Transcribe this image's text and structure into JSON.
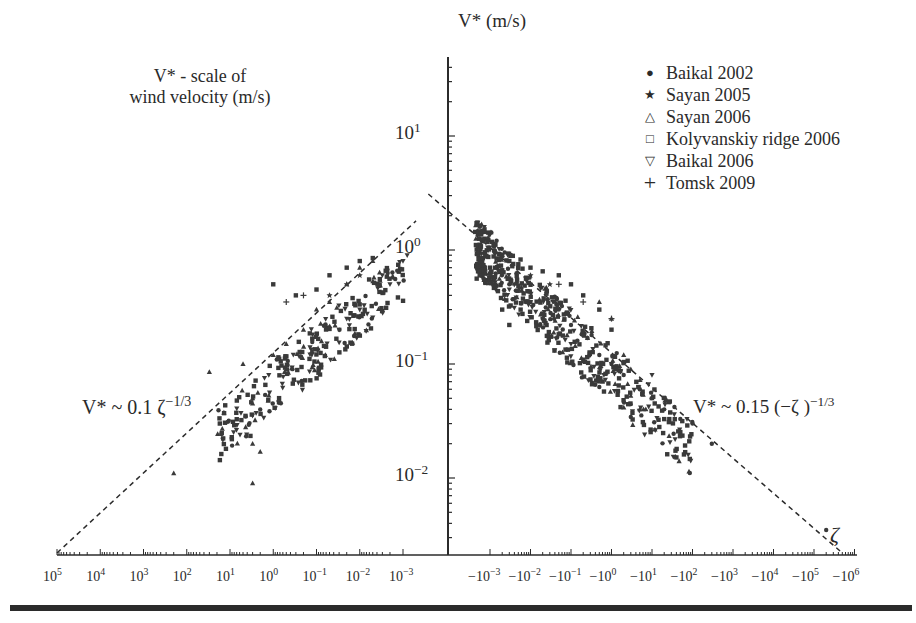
{
  "chart_data": {
    "type": "scatter",
    "title": "",
    "xlabel": "ζ",
    "ylabel": "V* (m/s)",
    "annotation_left_title": "V* - scale of wind velocity (m/s)",
    "xscale": "symlog (log of |ζ|, positive ζ on left decreasing toward center, negative ζ on right)",
    "yscale": "log",
    "ylim": [
      0.002,
      50
    ],
    "grid": false,
    "legend_position": "upper right",
    "y_ticks": [
      "10^1",
      "10^0",
      "10^-1",
      "10^-2"
    ],
    "x_ticks_left": [
      "10^5",
      "10^4",
      "10^3",
      "10^2",
      "10^1",
      "10^0",
      "10^-1",
      "10^-2",
      "10^-3"
    ],
    "x_ticks_right": [
      "-10^-3",
      "-10^-2",
      "-10^-1",
      "-10^0",
      "-10^1",
      "-10^2",
      "-10^3",
      "-10^4",
      "-10^5",
      "-10^6"
    ],
    "fit_lines": [
      {
        "label": "V* ~ 0.1 ζ^(-1/3)",
        "side": "stable (ζ>0)",
        "from": {
          "zeta": 100000,
          "v": 0.0022
        },
        "to": {
          "zeta": 0.0005,
          "v": 1.8
        }
      },
      {
        "label": "V* ~ 0.15 (-ζ)^(-1/3)",
        "side": "unstable (ζ<0)",
        "from": {
          "zeta": -3e-05,
          "v": 3.1
        },
        "to": {
          "zeta": -500000,
          "v": 0.0022
        }
      }
    ],
    "series": [
      {
        "name": "Baikal 2002",
        "marker": "circle",
        "points": [
          [
            -0.003,
            0.5
          ],
          [
            -0.01,
            0.35
          ],
          [
            -0.02,
            0.25
          ],
          [
            -0.05,
            0.3
          ],
          [
            -0.1,
            0.22
          ],
          [
            -0.2,
            0.18
          ],
          [
            -0.5,
            0.12
          ],
          [
            -1,
            0.1
          ],
          [
            -2,
            0.08
          ],
          [
            -5,
            0.06
          ],
          [
            -20,
            0.04
          ],
          [
            -50,
            0.033
          ],
          [
            -100,
            0.03
          ],
          [
            -300,
            0.02
          ],
          [
            -200000,
            0.0035
          ]
        ]
      },
      {
        "name": "Sayan 2005",
        "marker": "star",
        "points": [
          [
            0.05,
            0.4
          ],
          [
            0.02,
            0.5
          ],
          [
            0.01,
            0.6
          ],
          [
            -0.01,
            0.6
          ],
          [
            -0.03,
            0.5
          ]
        ]
      },
      {
        "name": "Sayan 2006",
        "marker": "triangle-up",
        "points": [
          [
            30,
            0.085
          ],
          [
            5,
            0.1
          ],
          [
            3,
            0.05
          ],
          [
            3,
            0.045
          ],
          [
            3,
            0.02
          ],
          [
            2,
            0.017
          ],
          [
            3,
            0.009
          ],
          [
            200,
            0.011
          ],
          [
            1,
            0.12
          ],
          [
            0.5,
            0.15
          ],
          [
            0.2,
            0.2
          ],
          [
            0.1,
            0.3
          ],
          [
            0.05,
            0.35
          ],
          [
            0.02,
            0.5
          ],
          [
            0.01,
            0.7
          ],
          [
            0.005,
            0.8
          ],
          [
            -0.5,
            0.35
          ],
          [
            -1,
            0.25
          ],
          [
            -2,
            0.12
          ],
          [
            -3,
            0.09
          ],
          [
            -10,
            0.05
          ],
          [
            -5,
            0.04
          ]
        ]
      },
      {
        "name": "Kolyvanskiy ridge 2006",
        "marker": "square",
        "points": [
          [
            1,
            0.5
          ],
          [
            0.3,
            0.4
          ],
          [
            0.1,
            0.45
          ],
          [
            0.05,
            0.6
          ],
          [
            0.02,
            0.7
          ],
          [
            0.01,
            0.8
          ],
          [
            0.005,
            0.85
          ],
          [
            -0.0005,
            0.75
          ],
          [
            -0.001,
            0.7
          ],
          [
            -0.002,
            0.9
          ],
          [
            -0.003,
            0.8
          ],
          [
            -0.005,
            0.75
          ],
          [
            -0.01,
            0.7
          ],
          [
            -0.02,
            0.65
          ],
          [
            -0.05,
            0.6
          ],
          [
            -0.1,
            0.5
          ],
          [
            -0.2,
            0.4
          ],
          [
            -0.5,
            0.3
          ],
          [
            -1,
            0.2
          ],
          [
            -0.002,
            0.3
          ],
          [
            -0.003,
            0.22
          ]
        ]
      },
      {
        "name": "Baikal 2006",
        "marker": "triangle-down",
        "points": [
          [
            0.003,
            0.6
          ],
          [
            0.002,
            0.5
          ],
          [
            0.001,
            0.8
          ],
          [
            0.0008,
            0.9
          ],
          [
            0.01,
            0.3
          ],
          [
            0.03,
            0.2
          ],
          [
            0.02,
            0.25
          ],
          [
            -0.001,
            1.0
          ],
          [
            -0.002,
            0.85
          ],
          [
            -0.003,
            0.45
          ],
          [
            -0.01,
            0.35
          ],
          [
            -0.02,
            0.25
          ],
          [
            -0.1,
            0.15
          ],
          [
            -1,
            0.1
          ],
          [
            -10,
            0.08
          ],
          [
            -20,
            0.05
          ]
        ]
      },
      {
        "name": "Tomsk 2009",
        "marker": "plus",
        "points": [
          [
            0.5,
            0.35
          ],
          [
            0.2,
            0.4
          ],
          [
            -0.05,
            0.5
          ],
          [
            -0.2,
            0.35
          ],
          [
            -1,
            0.25
          ]
        ]
      }
    ]
  },
  "labels": {
    "y_axis_title": "V* (m/s)",
    "left_note_line1": "V* - scale of",
    "left_note_line2": "wind velocity (m/s)",
    "fit_left": "V* ~ 0.1 ζ",
    "fit_left_exp": "−1/3",
    "fit_right": "V* ~ 0.15 (−ζ )",
    "fit_right_exp": "−1/3",
    "x_axis_symbol": "ζ"
  },
  "legend": [
    {
      "symbol": "●",
      "label": "Baikal 2002"
    },
    {
      "symbol": "★",
      "label": "Sayan 2005"
    },
    {
      "symbol": "△",
      "label": "Sayan 2006"
    },
    {
      "symbol": "□",
      "label": "Kolyvanskiy ridge 2006"
    },
    {
      "symbol": "▽",
      "label": "Baikal 2006"
    },
    {
      "symbol": "+",
      "label": "Tomsk 2009"
    }
  ],
  "y_tick_labels": [
    {
      "base": "10",
      "exp": "1"
    },
    {
      "base": "10",
      "exp": "0"
    },
    {
      "base": "10",
      "exp": "−1"
    },
    {
      "base": "10",
      "exp": "−2"
    }
  ],
  "x_tick_labels_left": [
    {
      "base": "10",
      "exp": "5"
    },
    {
      "base": "10",
      "exp": "4"
    },
    {
      "base": "10",
      "exp": "3"
    },
    {
      "base": "10",
      "exp": "2"
    },
    {
      "base": "10",
      "exp": "1"
    },
    {
      "base": "10",
      "exp": "0"
    },
    {
      "base": "10",
      "exp": "−1"
    },
    {
      "base": "10",
      "exp": "−2"
    },
    {
      "base": "10",
      "exp": "−3"
    }
  ],
  "x_tick_labels_right": [
    {
      "base": "−10",
      "exp": "−3"
    },
    {
      "base": "−10",
      "exp": "−2"
    },
    {
      "base": "−10",
      "exp": "−1"
    },
    {
      "base": "−10",
      "exp": "0"
    },
    {
      "base": "−10",
      "exp": "1"
    },
    {
      "base": "−10",
      "exp": "2"
    },
    {
      "base": "−10",
      "exp": "3"
    },
    {
      "base": "−10",
      "exp": "4"
    },
    {
      "base": "−10",
      "exp": "5"
    },
    {
      "base": "−10",
      "exp": "6"
    }
  ]
}
